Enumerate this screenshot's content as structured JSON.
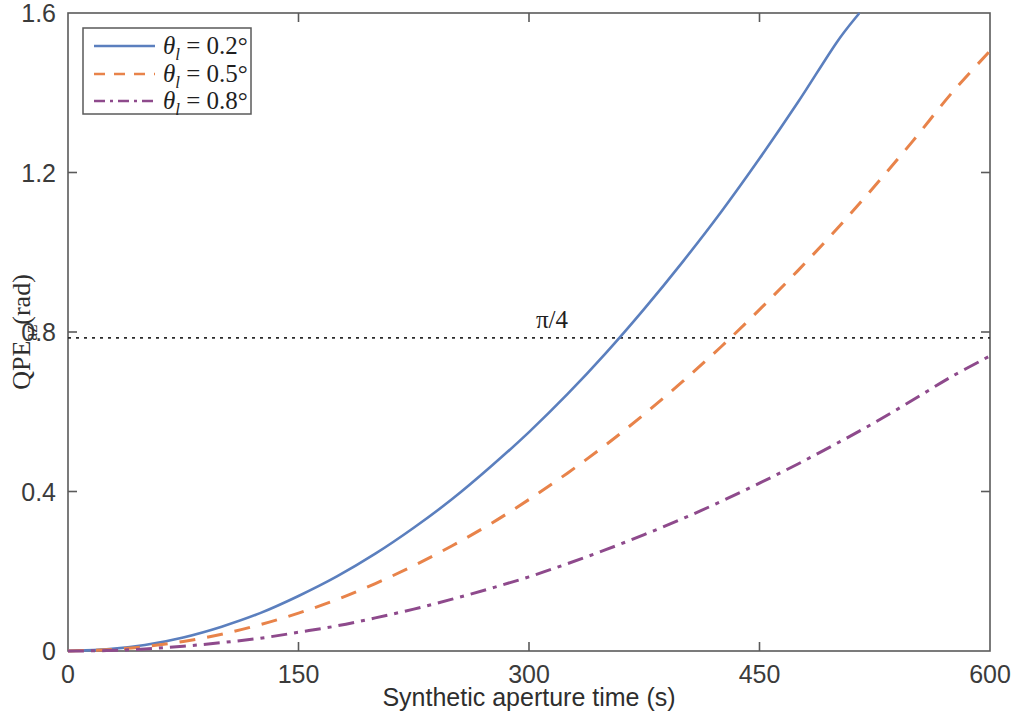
{
  "chart_data": {
    "type": "line",
    "title": "",
    "subtitle": "",
    "xlabel": "Synthetic aperture time (s)",
    "ylabel": "QPE_az (rad)",
    "ylabel_parts": {
      "main": "QPE",
      "subscript": "az",
      "unit": "(rad)"
    },
    "xlim": [
      0,
      600
    ],
    "ylim": [
      0,
      1.6
    ],
    "xticks": [
      0,
      150,
      300,
      450,
      600
    ],
    "xtick_labels": [
      "0",
      "150",
      "300",
      "450",
      "600"
    ],
    "yticks": [
      0,
      0.4,
      0.8,
      1.2,
      1.6
    ],
    "ytick_labels": [
      "0",
      "0.4",
      "0.8",
      "1.2",
      "1.6"
    ],
    "grid": false,
    "legend_position": "upper left",
    "annotations": [
      {
        "name": "pi-over-4-threshold",
        "label": "π/4",
        "type": "horizontal-line",
        "y": 0.7854,
        "x_label": 300,
        "style": "dotted",
        "color": "#2b2b2b"
      }
    ],
    "series": [
      {
        "name": "θ_l = 0.2°",
        "legend_label_main": "θ",
        "legend_label_sub": "l",
        "legend_label_rest": " = 0.2°",
        "theta_deg": 0.2,
        "color": "#5b7fbe",
        "style": "solid",
        "dasharray": "",
        "x": [
          0,
          25,
          50,
          75,
          100,
          125,
          150,
          175,
          200,
          225,
          250,
          275,
          300,
          325,
          350,
          375,
          400,
          425,
          450,
          475,
          500,
          515
        ],
        "y": [
          0,
          0.004,
          0.015,
          0.034,
          0.061,
          0.095,
          0.138,
          0.187,
          0.244,
          0.309,
          0.381,
          0.462,
          0.549,
          0.644,
          0.747,
          0.858,
          0.976,
          1.101,
          1.235,
          1.376,
          1.525,
          1.6
        ],
        "crosses_pi_over_4_at": 362,
        "value_at_600": null,
        "exits_top_at_x": 515
      },
      {
        "name": "θ_l = 0.5°",
        "legend_label_main": "θ",
        "legend_label_sub": "l",
        "legend_label_rest": " = 0.5°",
        "theta_deg": 0.5,
        "color": "#e8834a",
        "style": "dashed",
        "dasharray": "16 12",
        "x": [
          0,
          25,
          50,
          75,
          100,
          125,
          150,
          175,
          200,
          225,
          250,
          275,
          300,
          325,
          350,
          375,
          400,
          425,
          450,
          475,
          500,
          525,
          550,
          575,
          600
        ],
        "y": [
          0,
          0.003,
          0.011,
          0.024,
          0.042,
          0.066,
          0.095,
          0.129,
          0.169,
          0.214,
          0.264,
          0.319,
          0.38,
          0.446,
          0.517,
          0.594,
          0.676,
          0.763,
          0.856,
          0.954,
          1.057,
          1.166,
          1.28,
          1.399,
          1.505
        ],
        "crosses_pi_over_4_at": 434,
        "value_at_600": 1.5
      },
      {
        "name": "θ_l = 0.8°",
        "legend_label_main": "θ",
        "legend_label_sub": "l",
        "legend_label_rest": " = 0.8°",
        "theta_deg": 0.8,
        "color": "#8e4a8c",
        "style": "dashdot",
        "dasharray": "16 7 4 7",
        "x": [
          0,
          25,
          50,
          75,
          100,
          125,
          150,
          175,
          200,
          225,
          250,
          275,
          300,
          325,
          350,
          375,
          400,
          425,
          450,
          475,
          500,
          525,
          550,
          575,
          600
        ],
        "y": [
          0,
          0.001,
          0.005,
          0.012,
          0.021,
          0.032,
          0.047,
          0.063,
          0.083,
          0.105,
          0.13,
          0.157,
          0.186,
          0.219,
          0.254,
          0.292,
          0.332,
          0.375,
          0.421,
          0.469,
          0.52,
          0.573,
          0.63,
          0.688,
          0.74
        ],
        "crosses_pi_over_4_at": null,
        "value_at_600": 0.74
      }
    ]
  },
  "colors": {
    "series_1": "#5b7fbe",
    "series_2": "#e8834a",
    "series_3": "#8e4a8c",
    "axis": "#5a5a5a",
    "text": "#2e2e2e",
    "reference_line": "#2b2b2b",
    "background": "#ffffff"
  }
}
